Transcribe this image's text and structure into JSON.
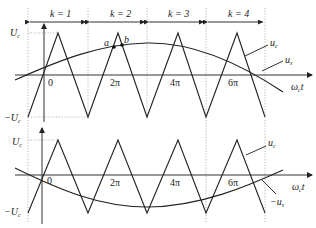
{
  "diagram": {
    "type": "pwm-sampling-waveforms",
    "top_panel": {
      "intervals": [
        {
          "label": "k = 1"
        },
        {
          "label": "k = 2"
        },
        {
          "label": "k = 3"
        },
        {
          "label": "k = 4"
        }
      ],
      "y_labels": {
        "top": "U",
        "top_sub": "c",
        "bottom": "−U",
        "bottom_sub": "c"
      },
      "origin_label": "0",
      "x_ticks": [
        "2π",
        "4π",
        "6π"
      ],
      "x_axis_label": "ω",
      "x_axis_sub": "c",
      "x_axis_suffix": "t",
      "curve_labels": {
        "carrier": "u",
        "carrier_sub": "c",
        "signal": "u",
        "signal_sub": "s"
      },
      "points": [
        {
          "label": "a"
        },
        {
          "label": "b"
        }
      ]
    },
    "bottom_panel": {
      "y_labels": {
        "top": "U",
        "top_sub": "c",
        "bottom": "−U",
        "bottom_sub": "c"
      },
      "origin_label": "0",
      "x_ticks": [
        "2π",
        "4π",
        "6π"
      ],
      "x_axis_label": "ω",
      "x_axis_sub": "c",
      "x_axis_suffix": "t",
      "curve_labels": {
        "carrier": "u",
        "carrier_sub": "c",
        "signal": "−u",
        "signal_sub": "s"
      }
    }
  }
}
